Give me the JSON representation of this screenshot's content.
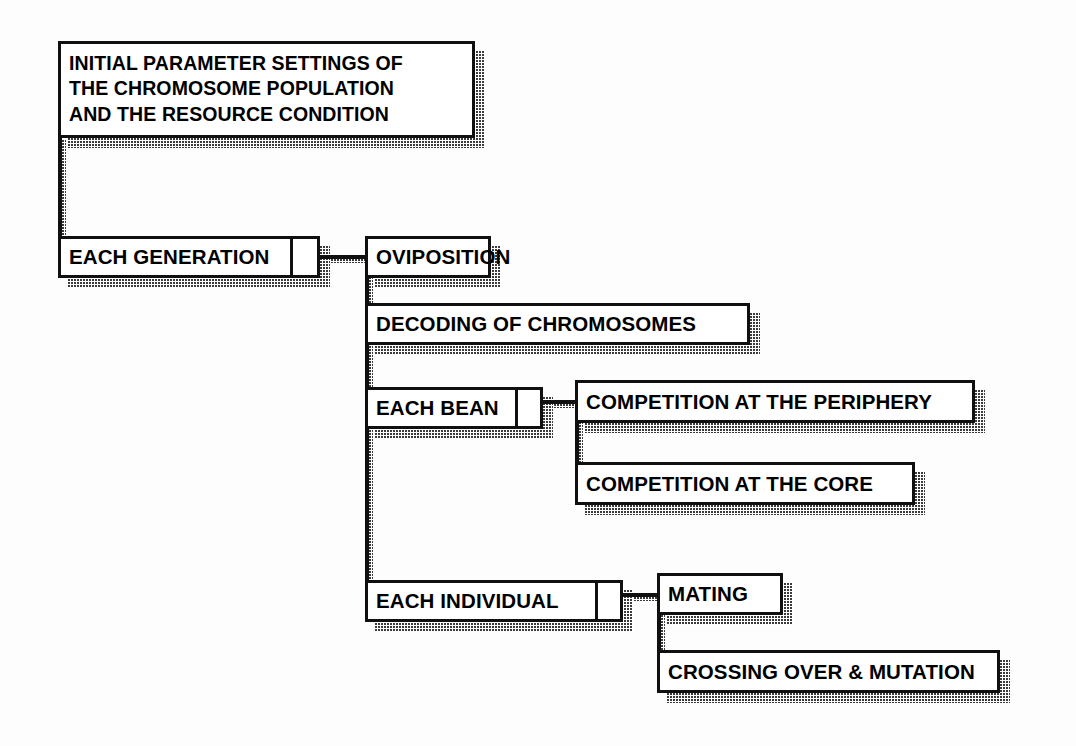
{
  "diagram": {
    "background_color": "#ffffff",
    "line_color": "#101010",
    "shadow_style": "halftone-dotted",
    "nodes": [
      {
        "id": "initial-parameters",
        "label": "INITIAL PARAMETER SETTINGS OF\nTHE CHROMOSOME  POPULATION\nAND THE RESOURCE CONDITION",
        "x": 58,
        "y": 41,
        "w": 417,
        "h": 97,
        "multiline": true,
        "loop_cell": false
      },
      {
        "id": "each-generation",
        "label": "EACH GENERATION",
        "x": 58,
        "y": 236,
        "w": 262,
        "h": 42,
        "multiline": false,
        "loop_cell": true,
        "divider_x": 290
      },
      {
        "id": "oviposition",
        "label": "OVIPOSITION",
        "x": 365,
        "y": 236,
        "w": 126,
        "h": 42,
        "multiline": false,
        "loop_cell": false
      },
      {
        "id": "decoding-of-chromosomes",
        "label": "DECODING OF CHROMOSOMES",
        "x": 365,
        "y": 303,
        "w": 385,
        "h": 42,
        "multiline": false,
        "loop_cell": false
      },
      {
        "id": "each-bean",
        "label": "EACH BEAN",
        "x": 365,
        "y": 387,
        "w": 178,
        "h": 42,
        "multiline": false,
        "loop_cell": true,
        "divider_x": 515
      },
      {
        "id": "competition-at-the-periphery",
        "label": "COMPETITION AT THE PERIPHERY",
        "x": 575,
        "y": 380,
        "w": 400,
        "h": 43,
        "multiline": false,
        "loop_cell": false
      },
      {
        "id": "competition-at-the-core",
        "label": "COMPETITION AT THE CORE",
        "x": 575,
        "y": 462,
        "w": 340,
        "h": 43,
        "multiline": false,
        "loop_cell": false
      },
      {
        "id": "each-individual",
        "label": "EACH INDIVIDUAL",
        "x": 365,
        "y": 580,
        "w": 258,
        "h": 42,
        "multiline": false,
        "loop_cell": true,
        "divider_x": 595
      },
      {
        "id": "mating",
        "label": "MATING",
        "x": 657,
        "y": 573,
        "w": 126,
        "h": 42,
        "multiline": false,
        "loop_cell": false
      },
      {
        "id": "crossing-over-and-mutation",
        "label": "CROSSING OVER & MUTATION",
        "x": 657,
        "y": 650,
        "w": 343,
        "h": 43,
        "multiline": false,
        "loop_cell": false
      }
    ],
    "connectors": [
      {
        "id": "initial-to-each-generation",
        "type": "vertical",
        "x": 58,
        "y": 136,
        "length": 102
      },
      {
        "id": "each-generation-to-oviposition",
        "type": "horizontal",
        "x": 318,
        "y": 255,
        "length": 50
      },
      {
        "id": "generation-spine",
        "type": "vertical",
        "x": 365,
        "y": 255,
        "length": 348
      },
      {
        "id": "each-bean-to-competition",
        "type": "horizontal",
        "x": 541,
        "y": 400,
        "length": 36
      },
      {
        "id": "bean-spine",
        "type": "vertical",
        "x": 575,
        "y": 400,
        "length": 85
      },
      {
        "id": "each-individual-to-mating",
        "type": "horizontal",
        "x": 621,
        "y": 593,
        "length": 38
      },
      {
        "id": "individual-spine",
        "type": "vertical",
        "x": 657,
        "y": 593,
        "length": 80
      }
    ]
  }
}
